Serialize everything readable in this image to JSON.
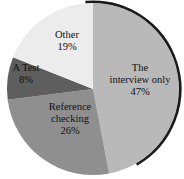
{
  "chart_data": {
    "type": "pie",
    "title": "",
    "slices": [
      {
        "label": "The interview only",
        "lines": [
          "The",
          "interview only",
          "47%"
        ],
        "value": 47,
        "color": "#b9b9b9"
      },
      {
        "label": "Reference checking",
        "lines": [
          "Reference",
          "checking",
          "26%"
        ],
        "value": 26,
        "color": "#8f8f8f"
      },
      {
        "label": "A Test",
        "lines": [
          "A Test",
          "8%"
        ],
        "value": 8,
        "color": "#5e5e5e"
      },
      {
        "label": "Other",
        "lines": [
          "Other",
          "19%"
        ],
        "value": 19,
        "color": "#ececec"
      }
    ],
    "start_angle_deg": 0,
    "direction": "clockwise",
    "outline_color": "#1a1a1a"
  }
}
